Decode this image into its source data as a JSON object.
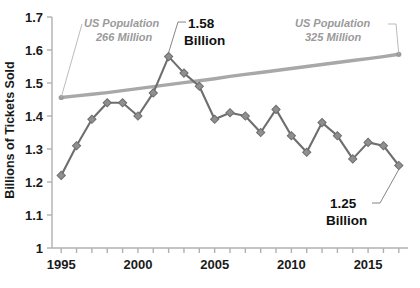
{
  "chart_data": {
    "type": "line",
    "title": "",
    "xlabel": "",
    "ylabel": "Billions of Tickets Sold",
    "xlim": [
      1994.4,
      2017.6
    ],
    "ylim": [
      1.0,
      1.7
    ],
    "yticks": [
      "1",
      "1.1",
      "1.2",
      "1.3",
      "1.4",
      "1.5",
      "1.6",
      "1.7"
    ],
    "ytick_values": [
      1.0,
      1.1,
      1.2,
      1.3,
      1.4,
      1.5,
      1.6,
      1.7
    ],
    "xticks_labeled": [
      "1995",
      "2000",
      "2005",
      "2010",
      "2015"
    ],
    "xtick_values": [
      1995,
      1996,
      1997,
      1998,
      1999,
      2000,
      2001,
      2002,
      2003,
      2004,
      2005,
      2006,
      2007,
      2008,
      2009,
      2010,
      2011,
      2012,
      2013,
      2014,
      2015,
      2016,
      2017
    ],
    "grid": false,
    "legend": "none",
    "x": [
      1995,
      1996,
      1997,
      1998,
      1999,
      2000,
      2001,
      2002,
      2003,
      2004,
      2005,
      2006,
      2007,
      2008,
      2009,
      2010,
      2011,
      2012,
      2013,
      2014,
      2015,
      2016,
      2017
    ],
    "series": [
      {
        "name": "Tickets Sold",
        "color": "#6e6e6e",
        "markers": true,
        "values": [
          1.22,
          1.31,
          1.39,
          1.44,
          1.44,
          1.4,
          1.47,
          1.58,
          1.53,
          1.49,
          1.39,
          1.41,
          1.4,
          1.35,
          1.42,
          1.34,
          1.29,
          1.38,
          1.34,
          1.27,
          1.32,
          1.31,
          1.25
        ]
      },
      {
        "name": "US Population",
        "color": "#a8a8a8",
        "markers": false,
        "values": [
          1.456,
          1.461,
          1.466,
          1.471,
          1.477,
          1.483,
          1.489,
          1.495,
          1.501,
          1.507,
          1.513,
          1.52,
          1.526,
          1.532,
          1.538,
          1.544,
          1.55,
          1.556,
          1.562,
          1.568,
          1.574,
          1.58,
          1.587
        ]
      }
    ],
    "annotations": [
      {
        "id": "us-population-start",
        "line1": "US Population",
        "line2": "266 Million",
        "style": "italic-gray",
        "target_x": 1995,
        "target_y": 1.456
      },
      {
        "id": "peak-value",
        "line1": "1.58",
        "line2": "Billion",
        "style": "bold-black",
        "target_x": 2002,
        "target_y": 1.58
      },
      {
        "id": "us-population-end",
        "line1": "US Population",
        "line2": "325 Million",
        "style": "italic-gray",
        "target_x": 2017,
        "target_y": 1.587
      },
      {
        "id": "final-value",
        "line1": "1.25",
        "line2": "Billion",
        "style": "bold-black",
        "target_x": 2017,
        "target_y": 1.25
      }
    ],
    "colors": {
      "tickets_line": "#6e6e6e",
      "population_line": "#a8a8a8",
      "axis": "#b0b0b0",
      "text": "#1a1a1a",
      "annotation_gray": "#9a9a9a",
      "background": "#ffffff"
    }
  }
}
